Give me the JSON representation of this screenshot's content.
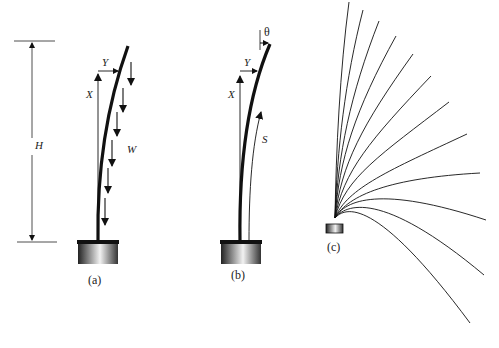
{
  "figure": {
    "panels": [
      {
        "id": "a",
        "caption": "(a)",
        "labels": {
          "height": "H",
          "x_axis": "X",
          "y_axis": "Y",
          "load": "W"
        },
        "description": "Cantilever pole bending under distributed weight W"
      },
      {
        "id": "b",
        "caption": "(b)",
        "labels": {
          "angle": "θ",
          "x_axis": "X",
          "y_axis": "Y",
          "arc_length": "S"
        },
        "description": "Deflected pole with tip angle θ and arc length S"
      },
      {
        "id": "c",
        "caption": "(c)",
        "description": "Family of deflection curves for increasing load",
        "curve_count": 14
      }
    ],
    "colors": {
      "line": "#111111",
      "background": "#ffffff"
    }
  }
}
